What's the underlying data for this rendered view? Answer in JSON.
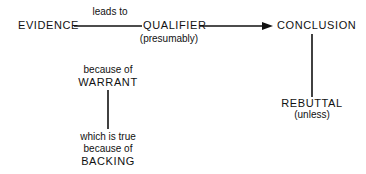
{
  "diagram": {
    "type": "argument-model",
    "nodes": {
      "evidence": {
        "label": "EVIDENCE"
      },
      "qualifier": {
        "label": "QUALIFIER",
        "note": "(presumably)"
      },
      "conclusion": {
        "label": "CONCLUSION"
      },
      "warrant": {
        "label": "WARRANT",
        "connector": "because of"
      },
      "backing": {
        "label": "BACKING",
        "connector_line1": "which is true",
        "connector_line2": "because of"
      },
      "rebuttal": {
        "label": "REBUTTAL",
        "note": "(unless)"
      }
    },
    "edges": [
      {
        "from": "evidence",
        "to": "qualifier",
        "label": "leads to",
        "arrow": false
      },
      {
        "from": "qualifier",
        "to": "conclusion",
        "label": "",
        "arrow": true
      },
      {
        "from": "warrant",
        "to": "backing",
        "label": "",
        "arrow": false
      },
      {
        "from": "conclusion",
        "to": "rebuttal",
        "label": "",
        "arrow": false
      }
    ],
    "colors": {
      "ink": "#111111",
      "background": "#ffffff"
    }
  }
}
